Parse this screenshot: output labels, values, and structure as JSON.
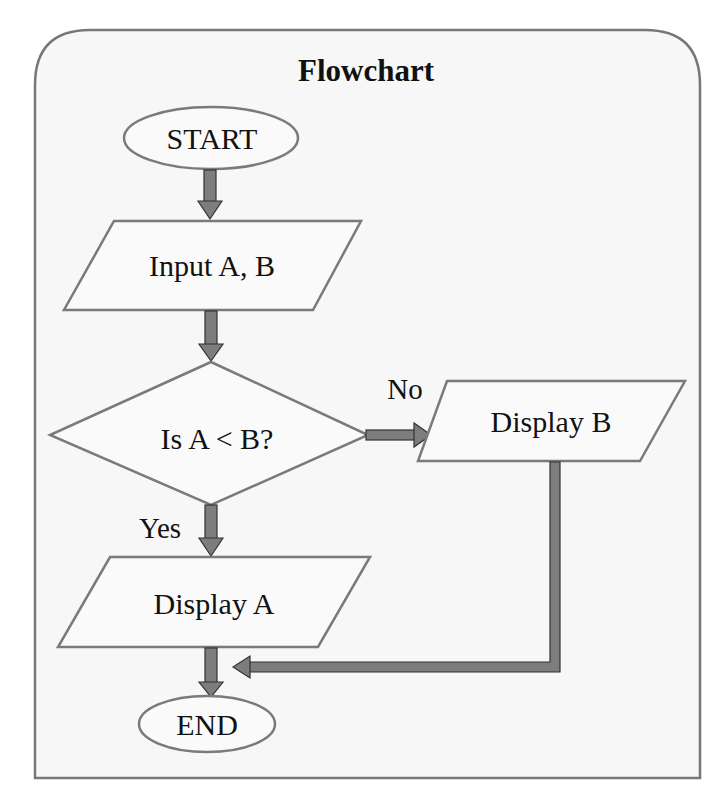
{
  "title": "Flowchart",
  "colors": {
    "panel_fill": "#f7f7f7",
    "panel_stroke": "#777777",
    "shape_fill": "#fafafa",
    "shape_stroke": "#7a7a7a",
    "arrow_fill": "#7d7d7d",
    "arrow_stroke": "#333333",
    "text": "#111111"
  },
  "nodes": {
    "start": {
      "type": "terminator",
      "label": "START"
    },
    "input": {
      "type": "input-output",
      "label": "Input A, B"
    },
    "decision": {
      "type": "decision",
      "label": "Is A < B?"
    },
    "display_b": {
      "type": "input-output",
      "label": "Display B"
    },
    "display_a": {
      "type": "input-output",
      "label": "Display A"
    },
    "end": {
      "type": "terminator",
      "label": "END"
    }
  },
  "edges": {
    "start_to_input": {
      "from": "START",
      "to": "Input A, B",
      "label": ""
    },
    "input_to_decision": {
      "from": "Input A, B",
      "to": "Is A < B?",
      "label": ""
    },
    "decision_no": {
      "from": "Is A < B?",
      "to": "Display B",
      "label": "No"
    },
    "decision_yes": {
      "from": "Is A < B?",
      "to": "Display A",
      "label": "Yes"
    },
    "display_a_to_end": {
      "from": "Display A",
      "to": "END",
      "label": ""
    },
    "display_b_to_end": {
      "from": "Display B",
      "to": "END",
      "label": ""
    }
  }
}
